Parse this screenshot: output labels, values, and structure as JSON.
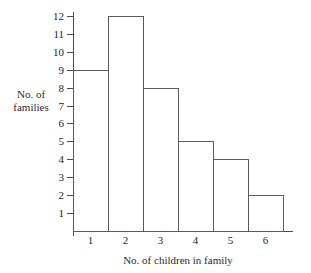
{
  "chart_data": {
    "type": "bar",
    "title": "",
    "subtitle": "",
    "xlabel": "No. of children in family",
    "ylabel": "No. of families",
    "ylabel_lines": [
      "No. of",
      "families"
    ],
    "categories": [
      "1",
      "2",
      "3",
      "4",
      "5",
      "6"
    ],
    "values": [
      9,
      12,
      8,
      5,
      4,
      2
    ],
    "series": [
      {
        "name": "No. of families",
        "values": [
          9,
          12,
          8,
          5,
          4,
          2
        ]
      }
    ],
    "x_tick_labels": [
      "1",
      "2",
      "3",
      "4",
      "5",
      "6"
    ],
    "y_tick_labels": [
      "12",
      "11",
      "10",
      "9",
      "8",
      "7",
      "6",
      "5",
      "4",
      "3",
      "2",
      "1"
    ],
    "y_tick_values": [
      12,
      11,
      10,
      9,
      8,
      7,
      6,
      5,
      4,
      3,
      2,
      1
    ],
    "ylim": [
      0,
      12
    ],
    "xlim": [
      0.5,
      6.5
    ],
    "grid": false,
    "legend": null,
    "legend_position": "none",
    "annotations": [],
    "style": {
      "bar_fill": "#ffffff",
      "bar_stroke": "#5a5a5a",
      "axis_color": "#4a4a4a",
      "text_color": "#1c1c1c",
      "background": "#ffffff",
      "bars_adjacent": true
    }
  }
}
